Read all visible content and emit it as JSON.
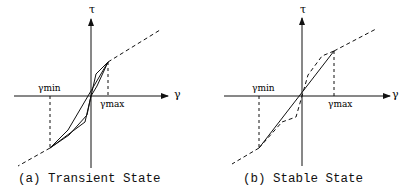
{
  "panels": [
    {
      "caption": "(a) Transient State",
      "y_axis_label": "τ",
      "x_axis_label": "γ",
      "gamma_min_label": "γmin",
      "gamma_max_label": "γmax"
    },
    {
      "caption": "(b) Stable State",
      "y_axis_label": "τ",
      "x_axis_label": "γ",
      "gamma_min_label": "γmin",
      "gamma_max_label": "γmax"
    }
  ]
}
